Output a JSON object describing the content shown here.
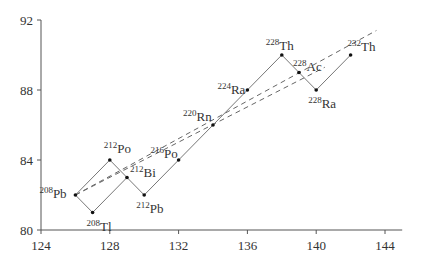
{
  "chart_data": {
    "type": "line",
    "title": "",
    "xlabel": "",
    "ylabel": "",
    "xlim": [
      124,
      145
    ],
    "ylim": [
      80,
      92
    ],
    "x_ticks": [
      124,
      128,
      132,
      136,
      140,
      144
    ],
    "y_ticks": [
      80,
      84,
      88,
      92
    ],
    "grid": false,
    "points": [
      {
        "mass": "232",
        "element": "Th",
        "x": 142,
        "y": 90
      },
      {
        "mass": "228",
        "element": "Ra",
        "x": 140,
        "y": 88
      },
      {
        "mass": "228",
        "element": "Ac",
        "x": 139,
        "y": 89
      },
      {
        "mass": "228",
        "element": "Th",
        "x": 138,
        "y": 90
      },
      {
        "mass": "224",
        "element": "Ra",
        "x": 136,
        "y": 88
      },
      {
        "mass": "220",
        "element": "Rn",
        "x": 134,
        "y": 86
      },
      {
        "mass": "216",
        "element": "Po",
        "x": 132,
        "y": 84
      },
      {
        "mass": "212",
        "element": "Pb",
        "x": 130,
        "y": 82
      },
      {
        "mass": "212",
        "element": "Bi",
        "x": 129,
        "y": 83
      },
      {
        "mass": "212",
        "element": "Po",
        "x": 128,
        "y": 84
      },
      {
        "mass": "208",
        "element": "Tl",
        "x": 127,
        "y": 81
      },
      {
        "mass": "208",
        "element": "Pb",
        "x": 126,
        "y": 82
      }
    ],
    "decay_edges": [
      [
        0,
        1
      ],
      [
        1,
        2
      ],
      [
        2,
        3
      ],
      [
        3,
        4
      ],
      [
        4,
        5
      ],
      [
        5,
        6
      ],
      [
        6,
        7
      ],
      [
        7,
        8
      ],
      [
        8,
        9
      ],
      [
        9,
        11
      ],
      [
        8,
        10
      ],
      [
        10,
        11
      ]
    ],
    "dashed_lines": [
      {
        "from": [
          126,
          82
        ],
        "to": [
          143.5,
          91.4
        ]
      },
      {
        "from": [
          126,
          82
        ],
        "to": [
          140.5,
          89.3
        ]
      }
    ],
    "colors": {
      "line": "#777777",
      "dashed": "#666666",
      "marker": "#111111",
      "axis": "#555555"
    }
  }
}
